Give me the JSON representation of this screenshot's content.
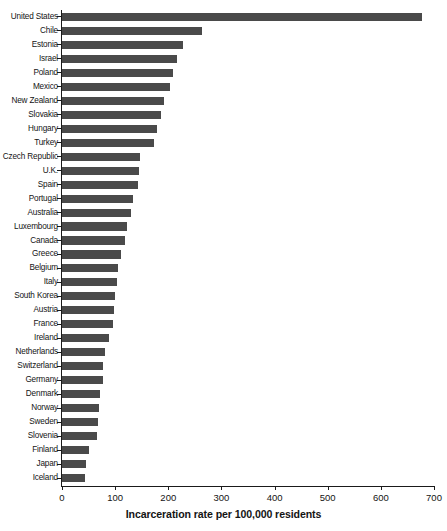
{
  "chart_data": {
    "type": "bar",
    "orientation": "horizontal",
    "title": "",
    "xlabel": "Incarceration rate per 100,000 residents",
    "ylabel": "",
    "xlim": [
      0,
      700
    ],
    "xticks": [
      0,
      100,
      200,
      300,
      400,
      500,
      600,
      700
    ],
    "grid": false,
    "legend": null,
    "bar_color": "#4a4a4a",
    "categories": [
      "United States",
      "Chile",
      "Estonia",
      "Israel",
      "Poland",
      "Mexico",
      "New Zealand",
      "Slovakia",
      "Hungary",
      "Turkey",
      "Czech Republic",
      "U.K.",
      "Spain",
      "Portugal",
      "Australia",
      "Luxembourg",
      "Canada",
      "Greece",
      "Belgium",
      "Italy",
      "South Korea",
      "Austria",
      "France",
      "Ireland",
      "Netherlands",
      "Switzerland",
      "Germany",
      "Denmark",
      "Norway",
      "Sweden",
      "Slovenia",
      "Finland",
      "Japan",
      "Iceland"
    ],
    "values": [
      678,
      263,
      227,
      217,
      209,
      204,
      192,
      187,
      179,
      173,
      147,
      145,
      143,
      133,
      130,
      123,
      118,
      111,
      105,
      104,
      99,
      98,
      96,
      88,
      81,
      78,
      77,
      72,
      70,
      67,
      65,
      51,
      45,
      43
    ]
  },
  "axis": {
    "x_title": "Incarceration rate per 100,000 residents",
    "x_tick_labels": [
      "0",
      "100",
      "200",
      "300",
      "400",
      "500",
      "600",
      "700"
    ]
  }
}
